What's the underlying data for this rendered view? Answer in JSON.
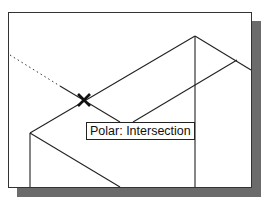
{
  "viewport": {
    "background": "#ffffff",
    "shadow_color": "#6b6b6b",
    "line_color": "#222222"
  },
  "snap_marker": {
    "icon": "intersection-x-marker",
    "x": 84,
    "y": 100
  },
  "tooltip": {
    "text": "Polar: Intersection"
  }
}
